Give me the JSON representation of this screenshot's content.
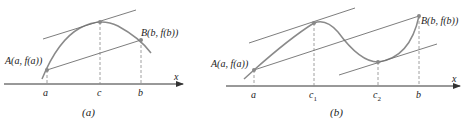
{
  "figures": [
    {
      "id": "a",
      "caption": "(a)",
      "axis_label": "x",
      "ticks": [
        "a",
        "c",
        "b"
      ],
      "points": [
        {
          "name": "A",
          "label": "A(a, f(a))"
        },
        {
          "name": "C",
          "label": ""
        },
        {
          "name": "B",
          "label": "B(b, f(b))"
        }
      ]
    },
    {
      "id": "b",
      "caption": "(b)",
      "axis_label": "x",
      "ticks": [
        "a",
        "c",
        "c",
        "b"
      ],
      "tick_subscripts": [
        "",
        "1",
        "2",
        ""
      ],
      "points": [
        {
          "name": "A",
          "label": "A(a, f(a))"
        },
        {
          "name": "C1",
          "label": ""
        },
        {
          "name": "C2",
          "label": ""
        },
        {
          "name": "B",
          "label": "B(b, f(b))"
        }
      ]
    }
  ],
  "colors": {
    "curve": "#8a8a8a",
    "lines": "#6e6e6e",
    "axis": "#333333",
    "text": "#222222"
  }
}
